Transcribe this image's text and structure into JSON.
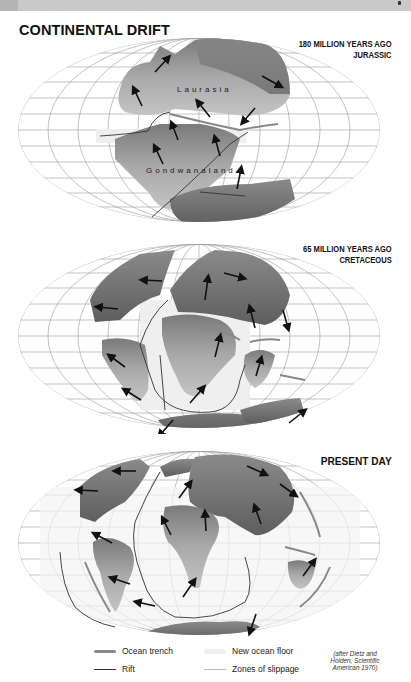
{
  "page": {
    "title": "CONTINENTAL DRIFT"
  },
  "maps": [
    {
      "era_line1": "180 MILLION YEARS AGO",
      "era_line2": "JURASSIC",
      "labels": [
        "Laurasia",
        "Gondwanaland"
      ]
    },
    {
      "era_line1": "65 MILLION YEARS AGO",
      "era_line2": "CRETACEOUS"
    },
    {
      "era_line1": "PRESENT DAY"
    }
  ],
  "legend": {
    "items": [
      {
        "icon": "ocean-trench-swatch",
        "label": "Ocean trench"
      },
      {
        "icon": "rift-swatch",
        "label": "Rift"
      },
      {
        "icon": "new-ocean-floor-swatch",
        "label": "New ocean floor"
      },
      {
        "icon": "zones-of-slippage-swatch",
        "label": "Zones of slippage"
      }
    ],
    "credit_line1": "(after Dietz and",
    "credit_line2": "Holden, Scientific",
    "credit_line3": "American 1970)"
  },
  "colors": {
    "land_dark": "#6f6f6f",
    "land_light": "#b9b9b9",
    "graticule": "#9a9a9a",
    "trench": "#888888",
    "rift": "#333333"
  }
}
